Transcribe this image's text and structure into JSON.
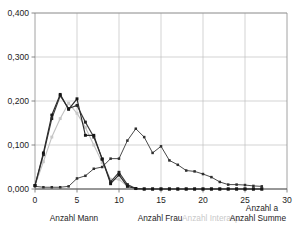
{
  "title": "",
  "chart_data": {
    "type": "line",
    "title": "",
    "xlabel": "",
    "ylabel": "",
    "xlim": [
      0,
      30
    ],
    "ylim": [
      0.0,
      0.4
    ],
    "grid": true,
    "legend_position": "bottom",
    "x_ticks": [
      "0",
      "5",
      "10",
      "15",
      "20",
      "25",
      "30"
    ],
    "x_tick_values": [
      0,
      5,
      10,
      15,
      20,
      25,
      30
    ],
    "y_ticks": [
      "0,000",
      "0,100",
      "0,200",
      "0,300",
      "0,400"
    ],
    "y_tick_values": [
      0.0,
      0.1,
      0.2,
      0.3,
      0.4
    ],
    "decimal_separator": ",",
    "series": [
      {
        "name": "Anzahl Mann",
        "color": "#2b2b2b",
        "x": [
          0,
          1,
          2,
          3,
          4,
          5,
          6,
          7,
          8,
          9,
          10,
          11,
          12,
          13,
          14,
          15,
          16,
          17,
          18,
          19,
          20,
          21,
          22,
          23,
          24,
          25,
          26,
          27
        ],
        "values": [
          0.008,
          0.082,
          0.168,
          0.215,
          0.181,
          0.205,
          0.122,
          0.122,
          0.068,
          0.012,
          0.032,
          0.006,
          0.001,
          0.0,
          0.0,
          0.0,
          0.0,
          0.0,
          0.0,
          0.0,
          0.0,
          0.0,
          0.0,
          0.0,
          0.0,
          0.0,
          0.0,
          0.0
        ]
      },
      {
        "name": "Anzahl Frau",
        "color": "#3a3a3a",
        "x": [
          0,
          1,
          2,
          3,
          4,
          5,
          6,
          7,
          8,
          9,
          10,
          11,
          12,
          13,
          14,
          15,
          16,
          17,
          18,
          19,
          20,
          21,
          22,
          23,
          24,
          25,
          26,
          27
        ],
        "values": [
          0.008,
          0.078,
          0.16,
          0.212,
          0.183,
          0.19,
          0.152,
          0.118,
          0.068,
          0.016,
          0.038,
          0.01,
          0.001,
          0.0,
          0.0,
          0.0,
          0.0,
          0.0,
          0.0,
          0.0,
          0.0,
          0.0,
          0.0,
          0.0,
          0.0,
          0.0,
          0.0,
          0.0
        ]
      },
      {
        "name": "Anzahl Interasp.",
        "color": "#c2c2c2",
        "x": [
          0,
          1,
          2,
          3,
          4,
          5,
          6,
          7,
          8,
          9,
          10,
          11,
          12,
          13,
          14,
          15,
          16,
          17,
          18,
          19,
          20,
          21,
          22,
          23,
          24,
          25,
          26,
          27
        ],
        "values": [
          0.008,
          0.062,
          0.118,
          0.16,
          0.195,
          0.172,
          0.14,
          0.1,
          0.06,
          0.022,
          0.022,
          0.006,
          0.001,
          0.0,
          0.0,
          0.0,
          0.0,
          0.0,
          0.0,
          0.0,
          0.0,
          0.0,
          0.0,
          0.0,
          0.0,
          0.0,
          0.0,
          0.0
        ]
      },
      {
        "name": "Anzahl Summe",
        "color": "#4a4a4a",
        "x": [
          0,
          1,
          2,
          3,
          4,
          5,
          6,
          7,
          8,
          9,
          10,
          11,
          12,
          13,
          14,
          15,
          16,
          17,
          18,
          19,
          20,
          21,
          22,
          23,
          24,
          25,
          26,
          27
        ],
        "values": [
          0.006,
          0.004,
          0.004,
          0.004,
          0.006,
          0.024,
          0.03,
          0.046,
          0.05,
          0.069,
          0.069,
          0.11,
          0.137,
          0.118,
          0.082,
          0.097,
          0.065,
          0.055,
          0.042,
          0.04,
          0.034,
          0.027,
          0.016,
          0.01,
          0.01,
          0.009,
          0.007,
          0.006
        ]
      }
    ],
    "legend": [
      {
        "label": "Anzahl Mann",
        "muted": false
      },
      {
        "label": "Anzahl Frau",
        "muted": false
      },
      {
        "label": "Anzahl Interasp.",
        "muted": true
      },
      {
        "label": "Anzahl a",
        "muted": false
      },
      {
        "label": "Anzahl Summe",
        "muted": false
      }
    ]
  }
}
